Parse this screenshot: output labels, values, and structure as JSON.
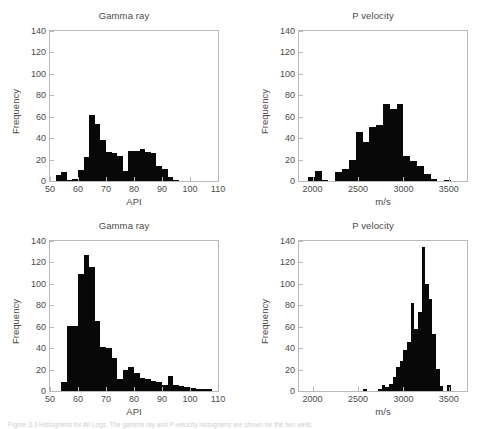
{
  "figure": {
    "caption": "Figure 3.3 Histograms for All Logs. The gamma ray and P-velocity histograms are shown for the two wells."
  },
  "axis_labels": {
    "frequency": "Frequency",
    "api": "API",
    "ms": "m/s"
  },
  "colors": {
    "bar": "#080808",
    "axis": "#b9b9b9",
    "text": "#4a4a4a",
    "background": "#ffffff"
  },
  "chart_data": [
    {
      "id": "top-left",
      "type": "bar",
      "title": "Gamma ray",
      "xlabel": "API",
      "ylabel": "Frequency",
      "xlim": [
        50,
        110
      ],
      "ylim": [
        0,
        140
      ],
      "xticks": [
        50,
        60,
        70,
        80,
        90,
        100,
        110
      ],
      "yticks": [
        0,
        20,
        40,
        60,
        80,
        100,
        120,
        140
      ],
      "grid": false,
      "bin_width": 2,
      "bin_starts": [
        52,
        54,
        56,
        58,
        60,
        62,
        64,
        66,
        68,
        70,
        72,
        74,
        76,
        78,
        80,
        82,
        84,
        86,
        88,
        90,
        92,
        94
      ],
      "values": [
        6,
        8,
        1,
        2,
        10,
        22,
        62,
        53,
        38,
        27,
        26,
        23,
        9,
        28,
        28,
        30,
        27,
        26,
        14,
        11,
        4,
        1
      ]
    },
    {
      "id": "top-right",
      "type": "bar",
      "title": "P velocity",
      "xlabel": "m/s",
      "ylabel": "Frequency",
      "xlim": [
        1850,
        3700
      ],
      "ylim": [
        0,
        140
      ],
      "xticks": [
        2000,
        2500,
        3000,
        3500
      ],
      "yticks": [
        0,
        20,
        40,
        60,
        80,
        100,
        120,
        140
      ],
      "grid": false,
      "bin_width": 75,
      "bin_starts": [
        1950,
        2025,
        2100,
        2175,
        2250,
        2325,
        2400,
        2475,
        2550,
        2625,
        2700,
        2775,
        2850,
        2925,
        3000,
        3075,
        3150,
        3225,
        3300,
        3375,
        3450
      ],
      "values": [
        4,
        9,
        1,
        0,
        8,
        11,
        20,
        46,
        36,
        50,
        52,
        72,
        67,
        72,
        23,
        19,
        14,
        7,
        2,
        0,
        1
      ]
    },
    {
      "id": "bottom-left",
      "type": "bar",
      "title": "Gamma ray",
      "xlabel": "API",
      "ylabel": "Frequency",
      "xlim": [
        50,
        110
      ],
      "ylim": [
        0,
        140
      ],
      "xticks": [
        50,
        60,
        70,
        80,
        90,
        100,
        110
      ],
      "yticks": [
        0,
        20,
        40,
        60,
        80,
        100,
        120,
        140
      ],
      "grid": false,
      "bin_width": 2,
      "bin_starts": [
        54,
        56,
        58,
        60,
        62,
        64,
        66,
        68,
        70,
        72,
        74,
        76,
        78,
        80,
        82,
        84,
        86,
        88,
        90,
        92,
        94,
        96,
        98,
        100,
        102,
        104,
        106
      ],
      "values": [
        8,
        61,
        61,
        109,
        127,
        116,
        65,
        41,
        40,
        31,
        11,
        20,
        22,
        17,
        12,
        11,
        9,
        8,
        6,
        14,
        6,
        5,
        4,
        3,
        2,
        2,
        2
      ]
    },
    {
      "id": "bottom-right",
      "type": "bar",
      "title": "P velocity",
      "xlabel": "m/s",
      "ylabel": "Frequency",
      "xlim": [
        1850,
        3700
      ],
      "ylim": [
        0,
        140
      ],
      "xticks": [
        2000,
        2500,
        3000,
        3500
      ],
      "yticks": [
        0,
        20,
        40,
        60,
        80,
        100,
        120,
        140
      ],
      "grid": false,
      "bin_width": 40,
      "bin_starts": [
        2560,
        2600,
        2720,
        2760,
        2800,
        2840,
        2880,
        2920,
        2960,
        3000,
        3040,
        3080,
        3120,
        3160,
        3200,
        3240,
        3280,
        3320,
        3360,
        3400,
        3440,
        3480
      ],
      "values": [
        2,
        0,
        2,
        6,
        4,
        7,
        13,
        22,
        28,
        38,
        46,
        82,
        58,
        74,
        134,
        100,
        86,
        53,
        21,
        5,
        0,
        6
      ]
    }
  ]
}
